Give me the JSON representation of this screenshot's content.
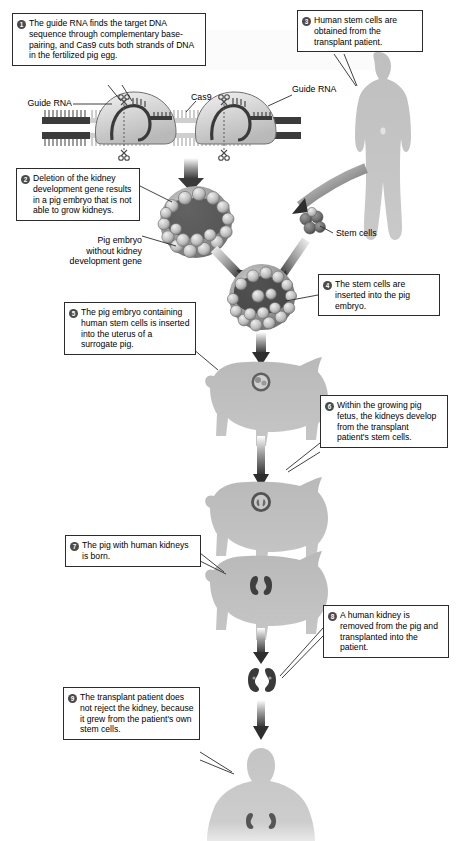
{
  "diagram": {
    "background_color": "#ffffff",
    "box_border_color": "#2b2b2b",
    "badge_color": "#4a4a4a",
    "silhouette_color": "#b5b5b5",
    "arrow_color": "#333333"
  },
  "steps": [
    {
      "number": "1",
      "text": "The guide RNA finds the target DNA sequence through complementary base-pairing, and Cas9 cuts both strands of DNA in the fertilized pig egg.",
      "name": "callout-step-1"
    },
    {
      "number": "2",
      "text": "Deletion of the kidney development gene results in a pig embryo that is not able to grow kidneys.",
      "name": "callout-step-2"
    },
    {
      "number": "3",
      "text": "Human stem cells are obtained from the transplant patient.",
      "name": "callout-step-3"
    },
    {
      "number": "4",
      "text": "The stem cells are inserted into the pig embryo.",
      "name": "callout-step-4"
    },
    {
      "number": "5",
      "text": "The pig embryo containing human stem cells is inserted into the uterus of a surrogate pig.",
      "name": "callout-step-5"
    },
    {
      "number": "6",
      "text": "Within the growing pig fetus, the kidneys develop from the transplant patient's stem cells.",
      "name": "callout-step-6"
    },
    {
      "number": "7",
      "text": "The pig with human kidneys is born.",
      "name": "callout-step-7"
    },
    {
      "number": "8",
      "text": "A human kidney is removed from the pig and transplanted into the patient.",
      "name": "callout-step-8"
    },
    {
      "number": "9",
      "text": "The transplant patient does not reject the kidney, because it grew from the patient's own stem cells.",
      "name": "callout-step-9"
    }
  ],
  "labels": {
    "guide_rna_left": "Guide RNA",
    "guide_rna_right": "Guide RNA",
    "cas9": "Cas9",
    "stem_cells": "Stem cells",
    "pig_embryo_caption_line1": "Pig embryo",
    "pig_embryo_caption_line2": "without kidney",
    "pig_embryo_caption_line3": "development gene"
  },
  "figures": [
    {
      "name": "dna-cas9-complex",
      "label": "Cas9 bound to DNA with guide RNA, two cut sites"
    },
    {
      "name": "human-patient-silhouette",
      "label": "Human transplant patient (donor of stem cells)"
    },
    {
      "name": "stem-cell-cluster",
      "label": "Cluster of human stem cells"
    },
    {
      "name": "pig-embryo-edited",
      "label": "Pig embryo without kidney development gene"
    },
    {
      "name": "pig-embryo-chimeric",
      "label": "Pig embryo containing human stem cells"
    },
    {
      "name": "surrogate-pig",
      "label": "Surrogate pig carrying embryo"
    },
    {
      "name": "pregnant-pig-fetus",
      "label": "Pig with developing fetus"
    },
    {
      "name": "newborn-pig",
      "label": "Pig born with human kidneys"
    },
    {
      "name": "harvested-kidney",
      "label": "Human kidney removed from pig"
    },
    {
      "name": "recipient-patient-silhouette",
      "label": "Transplant patient with new kidneys"
    }
  ]
}
